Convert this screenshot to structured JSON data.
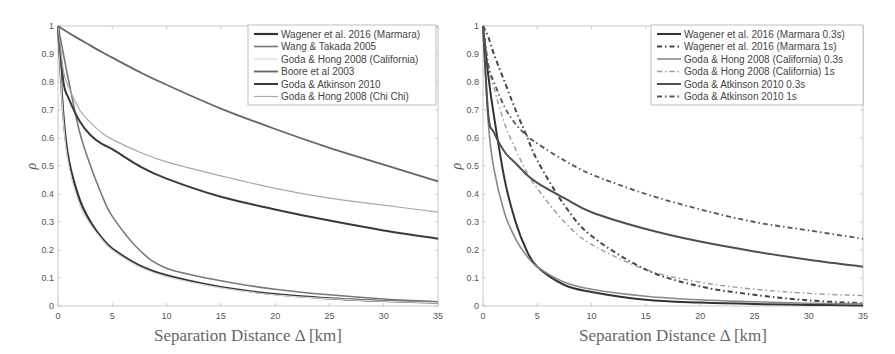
{
  "chart_data": [
    {
      "type": "line",
      "title": "",
      "xlabel": "Separation Distance Δ [km]",
      "ylabel": "ρ",
      "xlim": [
        0,
        35
      ],
      "ylim": [
        0,
        1
      ],
      "xticks": [
        0,
        5,
        10,
        15,
        20,
        25,
        30,
        35
      ],
      "yticks": [
        0,
        0.1,
        0.2,
        0.3,
        0.4,
        0.5,
        0.6,
        0.7,
        0.8,
        0.9,
        1
      ],
      "grid": false,
      "legend_position": "upper right",
      "x": [
        0,
        0.5,
        1,
        2,
        3,
        4,
        5,
        7.5,
        10,
        15,
        20,
        25,
        30,
        35
      ],
      "series": [
        {
          "name": "Wagener et al. 2016 (Marmara)",
          "color": "#333333",
          "width": 2.2,
          "dash": "",
          "values": [
            1.0,
            0.68,
            0.52,
            0.38,
            0.3,
            0.245,
            0.205,
            0.145,
            0.11,
            0.068,
            0.042,
            0.027,
            0.018,
            0.012
          ]
        },
        {
          "name": "Wang & Takada 2005",
          "color": "#777777",
          "width": 1.6,
          "dash": "",
          "values": [
            1.0,
            0.9,
            0.8,
            0.62,
            0.5,
            0.4,
            0.32,
            0.2,
            0.135,
            0.09,
            0.06,
            0.04,
            0.025,
            0.015
          ]
        },
        {
          "name": "Goda & Hong 2008 (California)",
          "color": "#d8d8d8",
          "width": 1.2,
          "dash": "",
          "values": [
            1.0,
            0.66,
            0.5,
            0.36,
            0.29,
            0.24,
            0.2,
            0.14,
            0.105,
            0.065,
            0.04,
            0.026,
            0.017,
            0.011
          ]
        },
        {
          "name": "Boore et al 2003",
          "color": "#666666",
          "width": 1.8,
          "dash": "",
          "values": [
            1.0,
            0.987,
            0.975,
            0.952,
            0.93,
            0.908,
            0.887,
            0.836,
            0.79,
            0.705,
            0.632,
            0.565,
            0.505,
            0.445
          ]
        },
        {
          "name": "Goda & Atkinson 2010",
          "color": "#3a3a3a",
          "width": 2.0,
          "dash": "",
          "values": [
            1.0,
            0.8,
            0.74,
            0.66,
            0.61,
            0.58,
            0.56,
            0.5,
            0.455,
            0.39,
            0.345,
            0.305,
            0.27,
            0.24
          ]
        },
        {
          "name": "Goda & Hong 2008 (Chi Chi)",
          "color": "#a8a8a8",
          "width": 1.2,
          "dash": "",
          "values": [
            1.0,
            0.84,
            0.78,
            0.7,
            0.655,
            0.62,
            0.595,
            0.55,
            0.515,
            0.465,
            0.42,
            0.385,
            0.36,
            0.335
          ]
        }
      ]
    },
    {
      "type": "line",
      "title": "",
      "xlabel": "Separation Distance Δ [km]",
      "ylabel": "ρ",
      "xlim": [
        0,
        35
      ],
      "ylim": [
        0,
        1
      ],
      "xticks": [
        0,
        5,
        10,
        15,
        20,
        25,
        30,
        35
      ],
      "yticks": [
        0,
        0.1,
        0.2,
        0.3,
        0.4,
        0.5,
        0.6,
        0.7,
        0.8,
        0.9,
        1
      ],
      "grid": false,
      "legend_position": "upper right",
      "x": [
        0,
        0.5,
        1,
        2,
        3,
        4,
        5,
        7.5,
        10,
        15,
        20,
        25,
        30,
        35
      ],
      "series": [
        {
          "name": "Wagener et al. 2016 (Marmara 0.3s)",
          "color": "#333333",
          "width": 2.0,
          "dash": "",
          "values": [
            1.0,
            0.82,
            0.68,
            0.45,
            0.3,
            0.2,
            0.14,
            0.075,
            0.05,
            0.022,
            0.012,
            0.007,
            0.004,
            0.002
          ]
        },
        {
          "name": "Wagener et al. 2016 (Marmara 1s)",
          "color": "#444444",
          "width": 2.0,
          "dash": "5,3,1.5,3",
          "values": [
            1.0,
            0.96,
            0.9,
            0.8,
            0.7,
            0.61,
            0.52,
            0.36,
            0.25,
            0.13,
            0.07,
            0.04,
            0.02,
            0.01
          ]
        },
        {
          "name": "Goda & Hong 2008 (California) 0.3s",
          "color": "#888888",
          "width": 1.6,
          "dash": "",
          "values": [
            1.0,
            0.65,
            0.49,
            0.33,
            0.24,
            0.18,
            0.14,
            0.085,
            0.06,
            0.035,
            0.022,
            0.015,
            0.01,
            0.007
          ]
        },
        {
          "name": "Goda & Hong 2008 (California) 1s",
          "color": "#999999",
          "width": 1.4,
          "dash": "5,3,1.5,3",
          "values": [
            1.0,
            0.86,
            0.78,
            0.65,
            0.56,
            0.48,
            0.42,
            0.3,
            0.22,
            0.13,
            0.085,
            0.06,
            0.045,
            0.037
          ]
        },
        {
          "name": "Goda & Atkinson 2010 0.3s",
          "color": "#505050",
          "width": 2.0,
          "dash": "",
          "values": [
            1.0,
            0.68,
            0.62,
            0.55,
            0.51,
            0.47,
            0.44,
            0.385,
            0.335,
            0.275,
            0.23,
            0.195,
            0.165,
            0.14
          ]
        },
        {
          "name": "Goda & Atkinson 2010 1s",
          "color": "#555555",
          "width": 1.8,
          "dash": "5,3,1.5,3",
          "values": [
            1.0,
            0.86,
            0.8,
            0.71,
            0.65,
            0.61,
            0.58,
            0.52,
            0.47,
            0.4,
            0.345,
            0.3,
            0.27,
            0.24
          ]
        }
      ]
    }
  ],
  "panels": [
    {
      "x0": 58,
      "x1": 438,
      "y0": 306,
      "y1": 26,
      "legend": {
        "x": 248,
        "y": 25,
        "w": 188,
        "h": 80
      }
    },
    {
      "x0": 483,
      "x1": 863,
      "y0": 306,
      "y1": 26,
      "legend": {
        "x": 651,
        "y": 25,
        "w": 212,
        "h": 80
      }
    }
  ]
}
